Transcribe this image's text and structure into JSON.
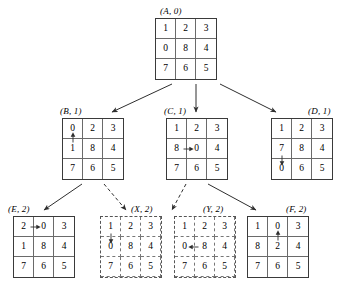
{
  "figure": {
    "kind": "search-tree-of-8-puzzle-states",
    "background_color": "#ffffff",
    "line_color": "#3a3a3a"
  },
  "nodes": [
    {
      "id": "A",
      "label": {
        "name": "A",
        "depth": "0",
        "text": "(A, 0)"
      },
      "style": "solid",
      "grid": [
        [
          "1",
          "2",
          "3"
        ],
        [
          "0",
          "8",
          "4"
        ],
        [
          "7",
          "6",
          "5"
        ]
      ],
      "move": null,
      "position": {
        "x": 155,
        "y": 18
      },
      "label_position": {
        "x": 160,
        "y": 6
      }
    },
    {
      "id": "B",
      "label": {
        "name": "B",
        "depth": "1",
        "text": "(B, 1)"
      },
      "style": "solid",
      "grid": [
        [
          "0",
          "2",
          "3"
        ],
        [
          "1",
          "8",
          "4"
        ],
        [
          "7",
          "6",
          "5"
        ]
      ],
      "move": {
        "direction": "up",
        "from_cell": [
          1,
          0
        ],
        "to_cell": [
          0,
          0
        ],
        "from_value": "1",
        "to_value": "0"
      },
      "position": {
        "x": 62,
        "y": 118
      },
      "label_position": {
        "x": 60,
        "y": 106
      }
    },
    {
      "id": "C",
      "label": {
        "name": "C",
        "depth": "1",
        "text": "(C, 1)"
      },
      "style": "solid",
      "grid": [
        [
          "1",
          "2",
          "3"
        ],
        [
          "8",
          "0",
          "4"
        ],
        [
          "7",
          "6",
          "5"
        ]
      ],
      "move": {
        "direction": "right",
        "from_cell": [
          1,
          0
        ],
        "to_cell": [
          1,
          1
        ],
        "from_value": "8",
        "to_value": "0"
      },
      "position": {
        "x": 166,
        "y": 118
      },
      "label_position": {
        "x": 164,
        "y": 106
      }
    },
    {
      "id": "D",
      "label": {
        "name": "D",
        "depth": "1",
        "text": "(D, 1)"
      },
      "style": "solid",
      "grid": [
        [
          "1",
          "2",
          "3"
        ],
        [
          "7",
          "8",
          "4"
        ],
        [
          "0",
          "6",
          "5"
        ]
      ],
      "move": {
        "direction": "down",
        "from_cell": [
          1,
          0
        ],
        "to_cell": [
          2,
          0
        ],
        "from_value": "7",
        "to_value": "0"
      },
      "position": {
        "x": 271,
        "y": 118
      },
      "label_position": {
        "x": 308,
        "y": 106
      }
    },
    {
      "id": "E",
      "label": {
        "name": "E",
        "depth": "2",
        "text": "(E, 2)"
      },
      "style": "solid",
      "grid": [
        [
          "2",
          "0",
          "3"
        ],
        [
          "1",
          "8",
          "4"
        ],
        [
          "7",
          "6",
          "5"
        ]
      ],
      "move": {
        "direction": "right",
        "from_cell": [
          0,
          0
        ],
        "to_cell": [
          0,
          1
        ],
        "from_value": "2",
        "to_value": "0"
      },
      "position": {
        "x": 13,
        "y": 216
      },
      "label_position": {
        "x": 8,
        "y": 204
      }
    },
    {
      "id": "X",
      "label": {
        "name": "X",
        "depth": "2",
        "text": "(X, 2)"
      },
      "style": "dashed",
      "grid": [
        [
          "1",
          "2",
          "3"
        ],
        [
          "0",
          "8",
          "4"
        ],
        [
          "7",
          "6",
          "5"
        ]
      ],
      "move": {
        "direction": "down",
        "from_cell": [
          0,
          0
        ],
        "to_cell": [
          1,
          0
        ],
        "from_value": "1",
        "to_value": "0"
      },
      "position": {
        "x": 100,
        "y": 216
      },
      "label_position": {
        "x": 131,
        "y": 204
      }
    },
    {
      "id": "Y",
      "label": {
        "name": "Y",
        "depth": "2",
        "text": "(Y, 2)"
      },
      "style": "dashed",
      "grid": [
        [
          "1",
          "2",
          "3"
        ],
        [
          "0",
          "8",
          "4"
        ],
        [
          "7",
          "6",
          "5"
        ]
      ],
      "move": {
        "direction": "left",
        "from_cell": [
          1,
          1
        ],
        "to_cell": [
          1,
          0
        ],
        "from_value": "8",
        "to_value": "0"
      },
      "position": {
        "x": 174,
        "y": 216
      },
      "label_position": {
        "x": 203,
        "y": 204
      }
    },
    {
      "id": "F",
      "label": {
        "name": "F",
        "depth": "2",
        "text": "(F, 2)"
      },
      "style": "solid",
      "grid": [
        [
          "1",
          "0",
          "3"
        ],
        [
          "8",
          "2",
          "4"
        ],
        [
          "7",
          "6",
          "5"
        ]
      ],
      "move": {
        "direction": "up",
        "from_cell": [
          1,
          1
        ],
        "to_cell": [
          0,
          1
        ],
        "from_value": "2",
        "to_value": "0"
      },
      "position": {
        "x": 247,
        "y": 216
      },
      "label_position": {
        "x": 286,
        "y": 204
      }
    }
  ],
  "edges": [
    {
      "from": "A",
      "to": "B",
      "style": "solid",
      "x1": 172,
      "y1": 84,
      "x2": 112,
      "y2": 112
    },
    {
      "from": "A",
      "to": "C",
      "style": "solid",
      "x1": 196,
      "y1": 84,
      "x2": 196,
      "y2": 112
    },
    {
      "from": "A",
      "to": "D",
      "style": "solid",
      "x1": 220,
      "y1": 84,
      "x2": 276,
      "y2": 112
    },
    {
      "from": "B",
      "to": "E",
      "style": "solid",
      "x1": 82,
      "y1": 184,
      "x2": 44,
      "y2": 210
    },
    {
      "from": "B",
      "to": "X",
      "style": "dashed",
      "x1": 104,
      "y1": 184,
      "x2": 126,
      "y2": 210
    },
    {
      "from": "C",
      "to": "Y",
      "style": "dashed",
      "x1": 186,
      "y1": 184,
      "x2": 172,
      "y2": 210
    },
    {
      "from": "C",
      "to": "F",
      "style": "solid",
      "x1": 208,
      "y1": 184,
      "x2": 256,
      "y2": 210
    }
  ]
}
